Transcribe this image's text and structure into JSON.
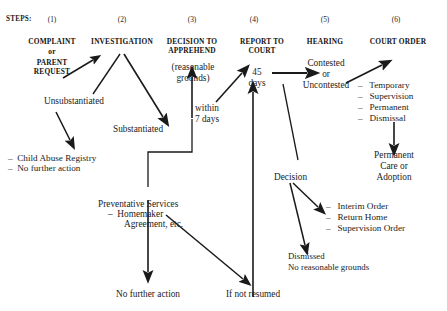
{
  "colors": {
    "ink": "#1c1c1c",
    "line": "#1a1a1a",
    "background": "#ffffff"
  },
  "steps_row": {
    "label": "STEPS:",
    "numbers": [
      "(1)",
      "(2)",
      "(3)",
      "(4)",
      "(5)",
      "(6)"
    ]
  },
  "headers": [
    {
      "id": "complaint",
      "line1": "COMPLAINT",
      "line2": "or",
      "line3": "PARENT",
      "line4": "REQUEST"
    },
    {
      "id": "investigation",
      "line1": "INVESTIGATION"
    },
    {
      "id": "decision-to-apprehend",
      "line1": "DECISION TO",
      "line2": "APPREHEND"
    },
    {
      "id": "report-to-court",
      "line1": "REPORT TO",
      "line2": "COURT"
    },
    {
      "id": "hearing",
      "line1": "HEARING"
    },
    {
      "id": "court-order",
      "line1": "COURT ORDER"
    }
  ],
  "nodes": {
    "reasonable_grounds_1": "(reasonable",
    "reasonable_grounds_2": "grounds)",
    "unsubstantiated": "Unsubstantiated",
    "substantiated": "Substantiated",
    "child_abuse_registry": "–  Child Abuse Registry",
    "no_further_action_registry": "–  No further action",
    "preventative_services_1": "Preventative Services",
    "preventative_services_2": "–  Homemaker",
    "preventative_services_3": "Agreement, etc.",
    "no_further_action_bottom": "No further action",
    "if_not_resumed": "If not resumed",
    "within_7_days_1": "within",
    "within_7_days_2": "7 days",
    "forty_five_days_1": "45",
    "forty_five_days_2": "days",
    "contested": "Contested",
    "or": "or",
    "uncontested": "Uncontested",
    "order_temporary": "–   Temporary",
    "order_supervision": "–   Supervision",
    "order_permanent": "–   Permanent",
    "order_dismissal": "–   Dismissal",
    "permanent_care_1": "Permanent",
    "permanent_care_2": "Care or",
    "permanent_care_3": "Adoption",
    "decision": "Decision",
    "interim_order": "–   Interim Order",
    "return_home": "–   Return Home",
    "supervision_order": "–   Supervision Order",
    "dismissed_1": "Dismissed",
    "dismissed_2": "No reasonable grounds"
  }
}
